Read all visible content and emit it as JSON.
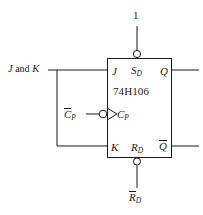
{
  "figure": {
    "type": "logic-schematic",
    "background_color": "#ffffff",
    "line_color": "#1a1a1a"
  },
  "chip": {
    "part_number": "74H106",
    "box": {
      "x": 107,
      "y": 58,
      "width": 65,
      "height": 100
    }
  },
  "pins": {
    "j": {
      "label": "J",
      "side": "left"
    },
    "k": {
      "label": "K",
      "side": "left"
    },
    "clock": {
      "label": "C",
      "subscript": "P",
      "side": "left",
      "inverted": true,
      "dynamic": true
    },
    "set": {
      "label": "S",
      "subscript": "D",
      "side": "top",
      "inverted": true
    },
    "reset": {
      "label": "R",
      "subscript": "D",
      "side": "bottom",
      "inverted": true
    },
    "q": {
      "label": "Q",
      "side": "right"
    },
    "q_not": {
      "label": "Q",
      "overbar": true,
      "side": "right"
    }
  },
  "external_labels": {
    "top_input": "1",
    "left_input": {
      "text": "J and K",
      "j": "J",
      "conjunction": " and ",
      "k": "K"
    },
    "clock_input": {
      "label": "C",
      "subscript": "P",
      "overbar": true
    },
    "reset_input": {
      "label": "R",
      "subscript": "D",
      "overbar": true
    }
  }
}
